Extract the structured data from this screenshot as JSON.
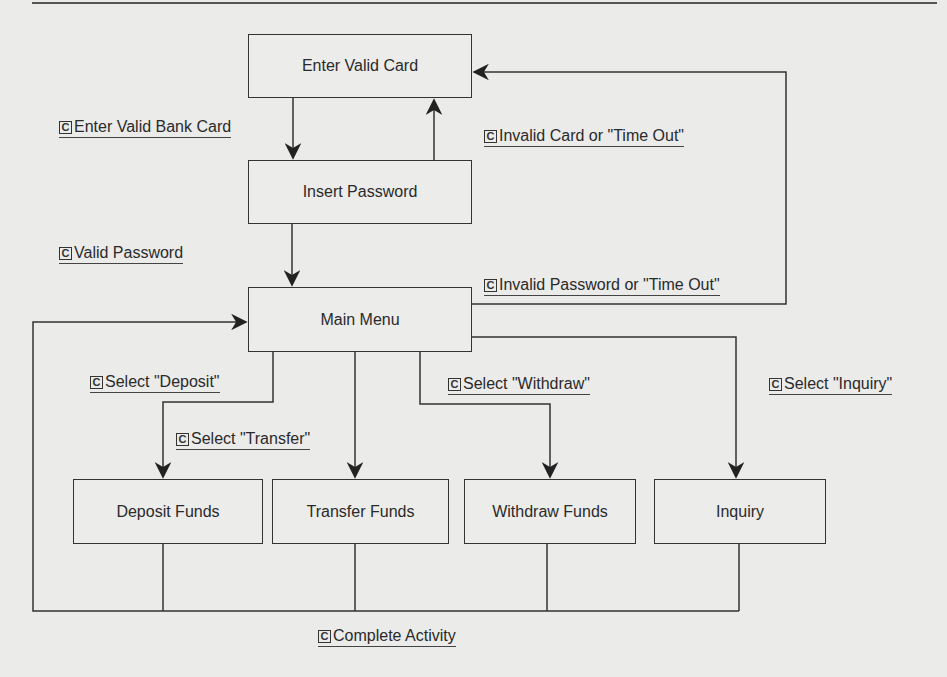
{
  "states": {
    "enter_valid_card": "Enter Valid Card",
    "insert_password": "Insert Password",
    "main_menu": "Main Menu",
    "deposit_funds": "Deposit Funds",
    "transfer_funds": "Transfer Funds",
    "withdraw_funds": "Withdraw Funds",
    "inquiry": "Inquiry"
  },
  "transitions": {
    "enter_valid_bank_card": "Enter Valid Bank Card",
    "invalid_card_or_timeout": "Invalid Card or \"Time Out\"",
    "valid_password": "Valid Password",
    "invalid_password_or_timeout": "Invalid Password or \"Time Out\"",
    "select_deposit": "Select \"Deposit\"",
    "select_transfer": "Select \"Transfer\"",
    "select_withdraw": "Select \"Withdraw\"",
    "select_inquiry": "Select \"Inquiry\"",
    "complete_activity": "Complete Activity"
  },
  "condition_icon": "C",
  "colors": {
    "line": "#333333",
    "background": "#ebebea"
  }
}
